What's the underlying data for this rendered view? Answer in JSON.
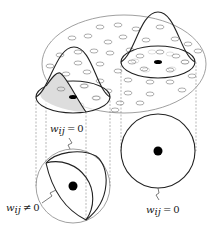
{
  "figure": {
    "labels": {
      "top_left": {
        "var": "w",
        "sub": "ij",
        "rel": "=",
        "val": "0"
      },
      "bottom_left": {
        "var": "w",
        "sub": "ij",
        "rel": "≠",
        "val": "0"
      },
      "bottom_right": {
        "var": "w",
        "sub": "ij",
        "rel": "=",
        "val": "0"
      }
    },
    "colors": {
      "line": "#222222",
      "light_line": "#888888",
      "shade": "#dddddd",
      "dot": "#000000"
    }
  }
}
